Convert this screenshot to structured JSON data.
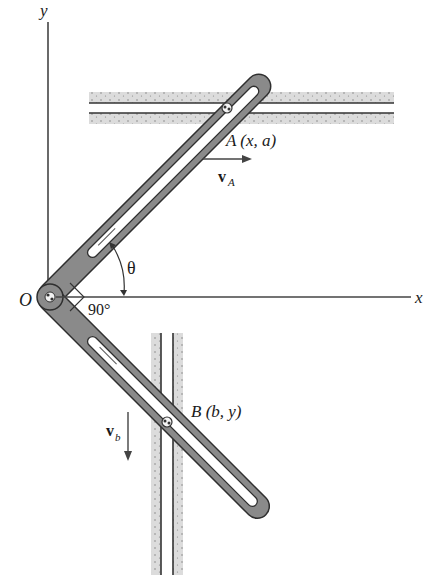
{
  "diagram": {
    "type": "mechanism",
    "axes": {
      "x_label": "x",
      "y_label": "y",
      "origin_label": "O"
    },
    "angles": {
      "theta_label": "θ",
      "right_angle_label": "90°"
    },
    "points": {
      "A": {
        "label": "A (x, a)",
        "name": "A",
        "coords": "(x, a)"
      },
      "B": {
        "label": "B (b, y)",
        "name": "B",
        "coords": "(b, y)"
      }
    },
    "velocities": {
      "vA": {
        "symbol": "v",
        "subscript": "A",
        "direction": "right"
      },
      "vb": {
        "symbol": "v",
        "subscript": "b",
        "direction": "down"
      }
    },
    "guides": [
      {
        "id": "horizontal-guide",
        "orientation": "horizontal",
        "through": "A"
      },
      {
        "id": "vertical-guide",
        "orientation": "vertical",
        "through": "B"
      }
    ],
    "arms": [
      {
        "id": "upper-arm",
        "angle_from_x": "θ"
      },
      {
        "id": "lower-arm",
        "angle_between_arms": "90°"
      }
    ],
    "colors": {
      "arm_fill": "#8a8a8a",
      "arm_edge": "#3a3a3a",
      "guide_fill": "#d9d9d9",
      "line": "#333333"
    }
  }
}
